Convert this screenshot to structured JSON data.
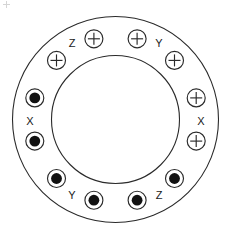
{
  "figure": {
    "background_color": "#ffffff",
    "line_color": "#2a2a2a",
    "fill_color": "#111111"
  },
  "geometry": {
    "center_x": 115.5,
    "center_y": 119.5,
    "outer_radius": 103,
    "inner_radius": 64,
    "slot_radius": 83.5,
    "slot_circle_radius": 9,
    "slot_dot_radius": 5.4,
    "slot_count": 12,
    "label_radius": 94
  },
  "slots": [
    {
      "index": 1,
      "angle_deg": -75,
      "marker": "cross",
      "phase": "Y",
      "cx": 137.1,
      "cy": 38.8
    },
    {
      "index": 2,
      "angle_deg": -45,
      "marker": "cross",
      "phase": "Y",
      "cx": 174.5,
      "cy": 60.4
    },
    {
      "index": 3,
      "angle_deg": -15,
      "marker": "cross",
      "phase": "X",
      "cx": 196.2,
      "cy": 97.9
    },
    {
      "index": 4,
      "angle_deg": 15,
      "marker": "cross",
      "phase": "X",
      "cx": 196.2,
      "cy": 141.1
    },
    {
      "index": 5,
      "angle_deg": 45,
      "marker": "dot",
      "phase": "Z",
      "cx": 174.5,
      "cy": 178.5
    },
    {
      "index": 6,
      "angle_deg": 75,
      "marker": "dot",
      "phase": "Z",
      "cx": 137.1,
      "cy": 200.2
    },
    {
      "index": 7,
      "angle_deg": 105,
      "marker": "dot",
      "phase": "Y",
      "cx": 93.9,
      "cy": 200.2
    },
    {
      "index": 8,
      "angle_deg": 135,
      "marker": "dot",
      "phase": "Y",
      "cx": 56.5,
      "cy": 178.5
    },
    {
      "index": 9,
      "angle_deg": 165,
      "marker": "dot",
      "phase": "X",
      "cx": 34.8,
      "cy": 141.1
    },
    {
      "index": 10,
      "angle_deg": 195,
      "marker": "dot",
      "phase": "X",
      "cx": 34.8,
      "cy": 97.9
    },
    {
      "index": 11,
      "angle_deg": 225,
      "marker": "cross",
      "phase": "Z",
      "cx": 56.5,
      "cy": 60.4
    },
    {
      "index": 12,
      "angle_deg": 255,
      "marker": "cross",
      "phase": "Z",
      "cx": 93.9,
      "cy": 38.8
    }
  ],
  "labels": [
    {
      "id": "label-z-top",
      "text": "Z",
      "x": 72,
      "y": 44,
      "phase": "Z",
      "position": "top-left"
    },
    {
      "id": "label-y-top",
      "text": "Y",
      "x": 159,
      "y": 44,
      "phase": "Y",
      "position": "top-right"
    },
    {
      "id": "label-x-left",
      "text": "X",
      "x": 30,
      "y": 122,
      "phase": "X",
      "position": "left"
    },
    {
      "id": "label-x-right",
      "text": "X",
      "x": 201,
      "y": 122,
      "phase": "X",
      "position": "right"
    },
    {
      "id": "label-y-bottom",
      "text": "Y",
      "x": 72,
      "y": 196,
      "phase": "Y",
      "position": "bottom-left"
    },
    {
      "id": "label-z-bottom",
      "text": "Z",
      "x": 159,
      "y": 196,
      "phase": "Z",
      "position": "bottom-right"
    }
  ],
  "legend": {
    "cross_meaning": "current into page",
    "dot_meaning": "current out of page"
  }
}
